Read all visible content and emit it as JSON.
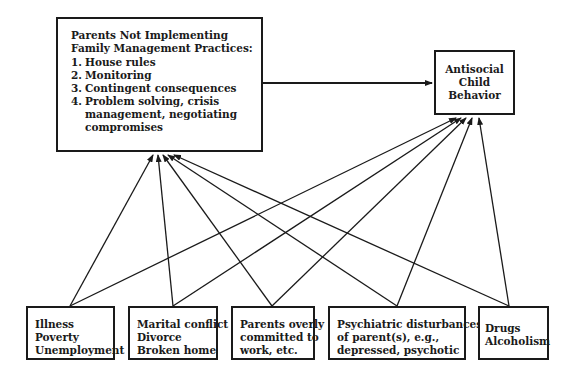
{
  "diagram": {
    "main_factor": {
      "title_line1": "Parents Not Implementing",
      "title_line2": "Family Management Practices:",
      "practices": [
        {
          "num": "1.",
          "label": "House rules"
        },
        {
          "num": "2.",
          "label": "Monitoring"
        },
        {
          "num": "3.",
          "label": "Contingent consequences"
        },
        {
          "num": "4.",
          "label": "Problem solving, crisis"
        },
        {
          "num": "",
          "label": "management, negotiating"
        },
        {
          "num": "",
          "label": "compromises"
        }
      ]
    },
    "outcome": {
      "line1": "Antisocial",
      "line2": "Child",
      "line3": "Behavior"
    },
    "stressors": [
      {
        "lines": [
          "Illness",
          "Poverty",
          "Unemployment"
        ]
      },
      {
        "lines": [
          "Marital conflict",
          "Divorce",
          "Broken home"
        ]
      },
      {
        "lines": [
          "Parents overly",
          "committed to",
          "work, etc."
        ]
      },
      {
        "lines": [
          "Psychiatric disturbances",
          "of parent(s), e.g.,",
          "depressed, psychotic"
        ]
      },
      {
        "lines": [
          "Drugs",
          "Alcoholism"
        ]
      }
    ],
    "edges": [
      {
        "from": "main_factor",
        "to": "outcome"
      },
      {
        "from": "stressors.0",
        "to": "main_factor"
      },
      {
        "from": "stressors.0",
        "to": "outcome"
      },
      {
        "from": "stressors.1",
        "to": "main_factor"
      },
      {
        "from": "stressors.1",
        "to": "outcome"
      },
      {
        "from": "stressors.2",
        "to": "main_factor"
      },
      {
        "from": "stressors.2",
        "to": "outcome"
      },
      {
        "from": "stressors.3",
        "to": "main_factor"
      },
      {
        "from": "stressors.3",
        "to": "outcome"
      },
      {
        "from": "stressors.4",
        "to": "main_factor"
      },
      {
        "from": "stressors.4",
        "to": "outcome"
      }
    ]
  }
}
